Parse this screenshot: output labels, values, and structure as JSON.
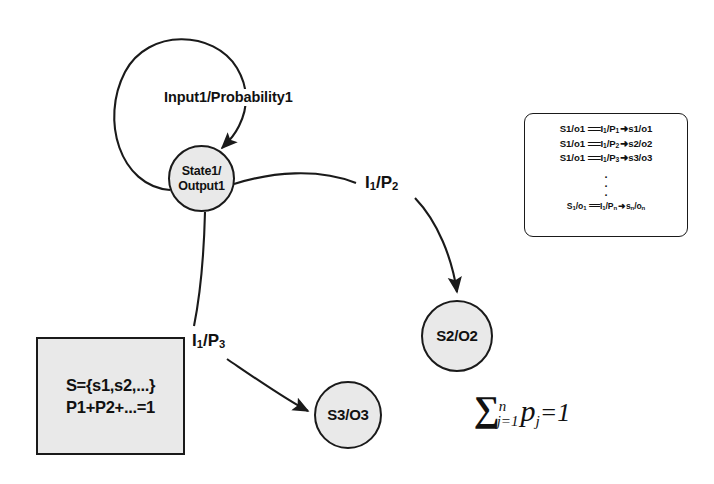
{
  "diagram": {
    "colors": {
      "node_fill": "#e9e9e9",
      "box_fill": "#e9e9e9",
      "stroke": "#1a1a1a",
      "background": "#ffffff"
    },
    "nodes": [
      {
        "id": "state1",
        "label_line1": "State1/",
        "label_line2": "Output1"
      },
      {
        "id": "state2",
        "label": "S2/O2"
      },
      {
        "id": "state3",
        "label": "S3/O3"
      }
    ],
    "edge_labels": {
      "self_loop": "Input1/Probability1",
      "to_state2_input": "I",
      "to_state2_input_sub": "1",
      "to_state2_sep": "/P",
      "to_state2_prob_sub": "2",
      "to_state3_input": "I",
      "to_state3_input_sub": "1",
      "to_state3_sep": "/P",
      "to_state3_prob_sub": "3"
    },
    "set_box": {
      "line1": "S={s1,s2,...}",
      "line2": "P1+P2+...=1"
    },
    "legend": {
      "rows": [
        {
          "source": "S1/o1",
          "equals": "===",
          "input": "I",
          "input_sub": "1",
          "slash": "/P",
          "prob_sub": "1",
          "arrow": "➜",
          "target": "s1/o1"
        },
        {
          "source": "S1/o1",
          "equals": "===",
          "input": "I",
          "input_sub": "1",
          "slash": "/P",
          "prob_sub": "2",
          "arrow": "➜",
          "target": "s2/o2"
        },
        {
          "source": "S1/o1",
          "equals": "===",
          "input": "I",
          "input_sub": "1",
          "slash": "/P",
          "prob_sub": "3",
          "arrow": "➜",
          "target": "s3/o3"
        }
      ],
      "ellipsis": ".",
      "last_row": {
        "source": "S",
        "source_sub": "1",
        "source_rest": "/o",
        "source_rest_sub": "1",
        "equals": "===",
        "input": "I",
        "input_sub": "1",
        "slash": "/P",
        "prob_sub": "n",
        "arrow": "➜",
        "target": "s",
        "target_sub": "n",
        "target_rest": "/o",
        "target_rest_sub": "n"
      }
    },
    "formula": {
      "sigma": "∑",
      "upper": "n",
      "lower": "j=1",
      "term": "p",
      "term_sub": "j",
      "tail": "=1"
    }
  }
}
